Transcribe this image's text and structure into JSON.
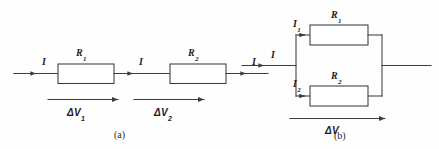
{
  "figure": {
    "type": "physics-circuit-diagram",
    "background_color": "#fefefe",
    "line_color": "#3c3c3e",
    "text_color": "#1d1d1f"
  },
  "panels": [
    {
      "id": "a",
      "caption": "(a)",
      "topology": "series",
      "currents": [
        {
          "label": "I",
          "position": "input-left"
        },
        {
          "label": "I",
          "position": "between-resistors"
        },
        {
          "label": "I",
          "position": "output-right"
        }
      ],
      "resistors": [
        {
          "symbol": "R",
          "subscript": "1"
        },
        {
          "symbol": "R",
          "subscript": "2"
        }
      ],
      "voltages": [
        {
          "symbol": "ΔV",
          "subscript": "1"
        },
        {
          "symbol": "ΔV",
          "subscript": "2"
        }
      ]
    },
    {
      "id": "b",
      "caption": "(b)",
      "topology": "parallel",
      "currents": [
        {
          "label": "I",
          "subscript": "",
          "position": "input-left"
        },
        {
          "label": "I",
          "subscript": "1",
          "position": "upper-branch"
        },
        {
          "label": "I",
          "subscript": "2",
          "position": "lower-branch"
        }
      ],
      "resistors": [
        {
          "symbol": "R",
          "subscript": "1",
          "branch": "upper"
        },
        {
          "symbol": "R",
          "subscript": "2",
          "branch": "lower"
        }
      ],
      "voltages": [
        {
          "symbol": "ΔV",
          "subscript": "",
          "span": "across-both-branches"
        }
      ]
    }
  ],
  "labels": {
    "a_I_in": "I",
    "a_I_mid": "I",
    "a_I_out": "I",
    "a_R1": "R",
    "a_R1_sub": "1",
    "a_R2": "R",
    "a_R2_sub": "2",
    "a_dV1": "ΔV",
    "a_dV1_sub": "1",
    "a_dV2": "ΔV",
    "a_dV2_sub": "2",
    "a_caption": "(a)",
    "b_I_in": "I",
    "b_I1": "I",
    "b_I1_sub": "1",
    "b_I2": "I",
    "b_I2_sub": "2",
    "b_R1": "R",
    "b_R1_sub": "1",
    "b_R2": "R",
    "b_R2_sub": "2",
    "b_dV": "ΔV",
    "b_caption": "(b)"
  }
}
